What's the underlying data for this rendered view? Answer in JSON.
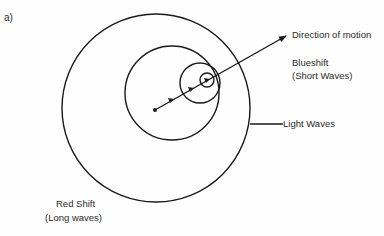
{
  "panel_label": "a)",
  "labels": {
    "direction": "Direction of motion",
    "blueshift_1": "Blueshift",
    "blueshift_2": "(Short Waves)",
    "light_waves": "Light Waves",
    "redshift_1": "Red Shift",
    "redshift_2": "(Long waves)"
  },
  "colors": {
    "stroke": "#1a1a1a",
    "background": "#fefefe"
  }
}
